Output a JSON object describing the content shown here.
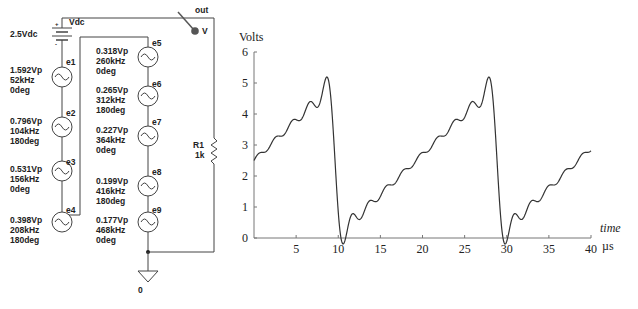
{
  "circuit": {
    "dc_source": {
      "name": "Vdc",
      "value": "2.5Vdc"
    },
    "probe": {
      "net": "out",
      "label": "V"
    },
    "resistor": {
      "name": "R1",
      "value": "1k"
    },
    "ground": {
      "label": "0"
    },
    "sources": [
      {
        "name": "e1",
        "amplitude": "1.592Vp",
        "freq": "52kHz",
        "phase": "0deg"
      },
      {
        "name": "e2",
        "amplitude": "0.796Vp",
        "freq": "104kHz",
        "phase": "180deg"
      },
      {
        "name": "e3",
        "amplitude": "0.531Vp",
        "freq": "156kHz",
        "phase": "0deg"
      },
      {
        "name": "e4",
        "amplitude": "0.398Vp",
        "freq": "208kHz",
        "phase": "180deg"
      },
      {
        "name": "e5",
        "amplitude": "0.318Vp",
        "freq": "260kHz",
        "phase": "0deg"
      },
      {
        "name": "e6",
        "amplitude": "0.265Vp",
        "freq": "312kHz",
        "phase": "180deg"
      },
      {
        "name": "e7",
        "amplitude": "0.227Vp",
        "freq": "364kHz",
        "phase": "0deg"
      },
      {
        "name": "e8",
        "amplitude": "0.199Vp",
        "freq": "416kHz",
        "phase": "180deg"
      },
      {
        "name": "e9",
        "amplitude": "0.177Vp",
        "freq": "468kHz",
        "phase": "0deg"
      }
    ]
  },
  "chart_data": {
    "type": "line",
    "title": "",
    "ylabel": "Volts",
    "xlabel": "time",
    "xunit": "µs",
    "xlim": [
      0,
      40
    ],
    "ylim": [
      0,
      6
    ],
    "xticks": [
      0,
      5,
      10,
      15,
      20,
      25,
      30,
      35,
      40
    ],
    "yticks": [
      0,
      1,
      2,
      3,
      4,
      5,
      6
    ],
    "grid": false,
    "series": [
      {
        "name": "V(out)",
        "description": "2.5V DC + 9-harmonic Fourier sawtooth, fundamental 52kHz",
        "dc_offset": 2.5,
        "fundamental_khz": 52,
        "amplitudes": [
          1.592,
          0.796,
          0.531,
          0.398,
          0.318,
          0.265,
          0.227,
          0.199,
          0.177
        ],
        "phases_deg": [
          0,
          180,
          0,
          180,
          0,
          180,
          0,
          180,
          0
        ],
        "key_points": [
          {
            "x": 0,
            "y": 2.5
          },
          {
            "x": 8.6,
            "y": 5.2
          },
          {
            "x": 10.5,
            "y": -0.2
          },
          {
            "x": 19.2,
            "y": 2.5
          },
          {
            "x": 27.8,
            "y": 5.2
          },
          {
            "x": 29.8,
            "y": -0.2
          },
          {
            "x": 40,
            "y": 2.9
          }
        ]
      }
    ]
  },
  "tick_labels": {
    "x": [
      "5",
      "10",
      "15",
      "20",
      "25",
      "30",
      "35",
      "40"
    ],
    "y": [
      "0",
      "1",
      "2",
      "3",
      "4",
      "5",
      "6"
    ]
  }
}
